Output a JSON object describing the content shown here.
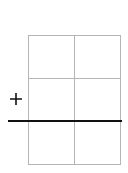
{
  "diagram": {
    "grid": {
      "rows": 3,
      "cols": 2,
      "line_color": "#b5b5b5"
    },
    "bar_line_color": "#111111",
    "symbol": "plus-icon"
  }
}
